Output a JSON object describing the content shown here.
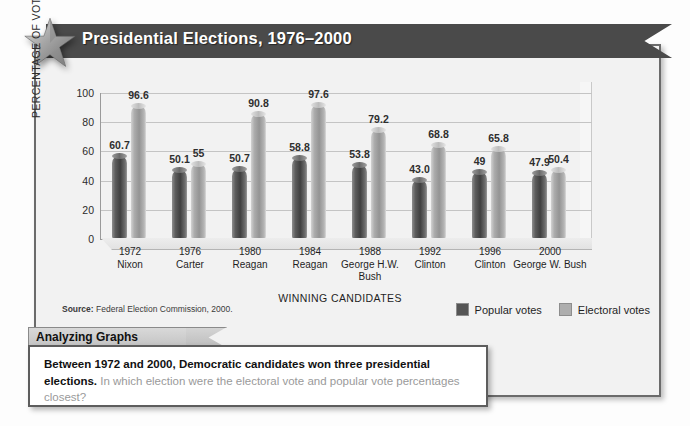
{
  "banner": {
    "title": "Presidential Elections, 1976–2000",
    "star_icon": "star-icon"
  },
  "chart_data": {
    "type": "bar",
    "title": "Presidential Elections, 1976–2000",
    "xlabel": "WINNING CANDIDATES",
    "ylabel": "PERCENTAGE OF VOTES CAST",
    "ylim": [
      0,
      100
    ],
    "yticks": [
      0,
      20,
      40,
      60,
      80,
      100
    ],
    "grid": true,
    "legend_position": "bottom-right",
    "categories": [
      "1972",
      "1976",
      "1980",
      "1984",
      "1988",
      "1992",
      "1996",
      "2000"
    ],
    "category_sublabels": [
      "Nixon",
      "Carter",
      "Reagan",
      "Reagan",
      "George H.W. Bush",
      "Clinton",
      "Clinton",
      "George W. Bush"
    ],
    "series": [
      {
        "name": "Popular votes",
        "color": "#555555",
        "values": [
          60.7,
          50.1,
          50.7,
          58.8,
          53.8,
          43.0,
          49,
          47.9
        ],
        "labels": [
          "60.7",
          "50.1",
          "50.7",
          "58.8",
          "53.8",
          "43.0",
          "49",
          "47.9"
        ]
      },
      {
        "name": "Electoral votes",
        "color": "#aeaeae",
        "values": [
          96.6,
          55,
          90.8,
          97.6,
          79.2,
          68.8,
          65.8,
          50.4
        ],
        "labels": [
          "96.6",
          "55",
          "90.8",
          "97.6",
          "79.2",
          "68.8",
          "65.8",
          "50.4"
        ]
      }
    ]
  },
  "source": {
    "prefix": "Source:",
    "text": "Federal Election Commission, 2000."
  },
  "callout": {
    "tab_label": "Analyzing Graphs",
    "bold_text": "Between 1972 and 2000, Democratic candidates won three presidential elections.",
    "question_text": "In which election were the electoral vote and popular vote percentages closest?"
  }
}
